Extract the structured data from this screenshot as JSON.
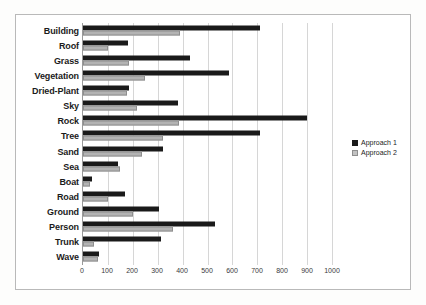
{
  "chart_data": {
    "type": "bar",
    "orientation": "horizontal",
    "title": "",
    "xlabel": "",
    "ylabel": "",
    "xlim": [
      0,
      1000
    ],
    "xticks": [
      0,
      100,
      200,
      300,
      400,
      500,
      600,
      700,
      800,
      900,
      1000
    ],
    "grid": true,
    "legend_position": "right",
    "categories": [
      "Building",
      "Roof",
      "Grass",
      "Vegetation",
      "Dried-Plant",
      "Sky",
      "Rock",
      "Tree",
      "Sand",
      "Sea",
      "Boat",
      "Road",
      "Ground",
      "Person",
      "Trunk",
      "Wave"
    ],
    "series": [
      {
        "name": "Approach 1",
        "color": "#1a1a1a",
        "values": [
          710,
          180,
          430,
          585,
          185,
          380,
          900,
          710,
          320,
          140,
          35,
          170,
          305,
          530,
          315,
          65
        ]
      },
      {
        "name": "Approach 2",
        "color": "#b3b3b3",
        "values": [
          390,
          100,
          185,
          250,
          175,
          215,
          385,
          320,
          235,
          150,
          30,
          100,
          200,
          360,
          45,
          60
        ]
      }
    ]
  }
}
